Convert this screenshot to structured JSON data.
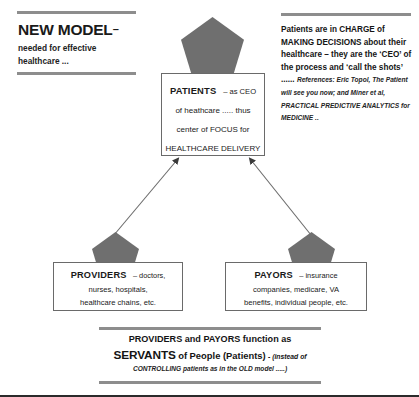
{
  "headline": {
    "title": "NEW MODEL",
    "dash": "–",
    "subtitle": "needed for effective healthcare ..."
  },
  "note": {
    "body": "Patients are in CHARGE of MAKING DECISIONS about their healthcare – they are the ‘CEO’ of the process and ‘call the shots’ ......",
    "reference": "References:  Eric Topol, The Patient will see you now;  and Miner et al, PRACTICAL PREDICTIVE ANALYTICS for MEDICINE .."
  },
  "patients": {
    "label": "PATIENTS",
    "label_tail": "– as CEO",
    "line2": "of heathcare ..... thus",
    "line3": "center of FOCUS for",
    "line4": "HEALTHCARE DELIVERY"
  },
  "providers": {
    "label": "PROVIDERS",
    "label_tail": "– doctors,",
    "line2": "nurses, hospitals,",
    "line3": "healthcare chains, etc."
  },
  "payors": {
    "label": "PAYORS",
    "label_tail": "– insurance",
    "line2": "companies, medicare, VA",
    "line3": "benefits, individual people, etc."
  },
  "summary": {
    "line1": "PROVIDERS and PAYORS function as",
    "line2_big": "SERVANTS",
    "line2_mid": "of People (Patients)",
    "line2_paren": "- (instead of",
    "line3": "CONTROLLING patients as in the OLD model .....)"
  },
  "colors": {
    "pentagon_fill": "#6f6f6f",
    "rule": "#8d8d8d",
    "box_border": "#6a6a6a",
    "connector": "#6b6b6b",
    "text": "#1a1a1a"
  }
}
